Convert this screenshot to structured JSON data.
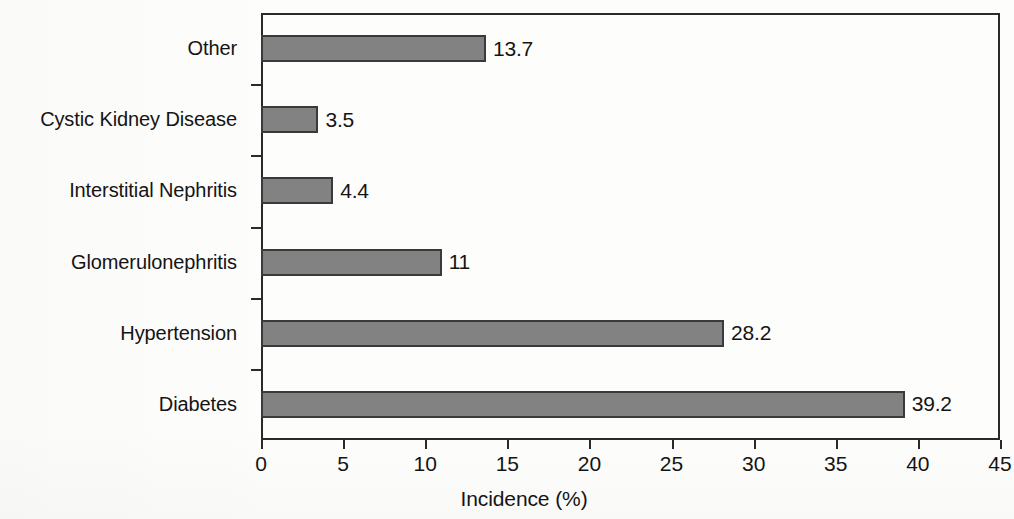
{
  "chart_data": {
    "type": "bar",
    "orientation": "horizontal",
    "title": "",
    "xlabel": "Incidence (%)",
    "ylabel": "",
    "xlim": [
      0,
      45
    ],
    "xticks": [
      0,
      5,
      10,
      15,
      20,
      25,
      30,
      35,
      40,
      45
    ],
    "xtick_labels": [
      "0",
      "5",
      "10",
      "15",
      "20",
      "25",
      "30",
      "35",
      "40",
      "45"
    ],
    "grid": false,
    "legend": null,
    "bar_color": "#828282",
    "bar_edge_color": "#3a3a3a",
    "text_color": "#141414",
    "axis_color": "#2a2a2a",
    "categories": [
      "Other",
      "Cystic Kidney Disease",
      "Interstitial Nephritis",
      "Glomerulonephritis",
      "Hypertension",
      "Diabetes"
    ],
    "values": [
      13.7,
      3.5,
      4.4,
      11,
      28.2,
      39.2
    ],
    "value_labels": [
      "13.7",
      "3.5",
      "4.4",
      "11",
      "28.2",
      "39.2"
    ]
  }
}
